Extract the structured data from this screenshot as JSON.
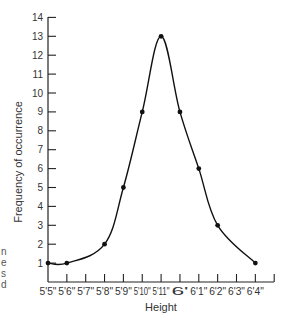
{
  "chart_data": {
    "type": "line",
    "title": "",
    "xlabel": "Height",
    "ylabel": "Frequency of occurrence",
    "categories": [
      "5'5\"",
      "5'6\"",
      "5'7\"",
      "5'8\"",
      "5'9\"",
      "5'10\"",
      "5'11\"",
      "6'",
      "6'1\"",
      "6'2\"",
      "6'3\"",
      "6'4\""
    ],
    "x_tick_labels": [
      "5'5\"",
      "5'6\"",
      "5'7\"",
      "5'8\"",
      "5'9\"",
      "5'10\"",
      "5'11\"",
      "6'",
      "6'1\"",
      "6'2\"",
      "6'3\"",
      "6'4\""
    ],
    "y_ticks": [
      1,
      2,
      3,
      4,
      5,
      6,
      7,
      8,
      9,
      10,
      11,
      12,
      13,
      14
    ],
    "ylim": [
      0,
      14
    ],
    "grid": false,
    "legend": null,
    "smooth_curve": true,
    "series": [
      {
        "name": "Frequency",
        "points": [
          {
            "x": "5'5\"",
            "y": 1
          },
          {
            "x": "5'6\"",
            "y": 1
          },
          {
            "x": "5'8\"",
            "y": 2
          },
          {
            "x": "5'9\"",
            "y": 5
          },
          {
            "x": "5'10\"",
            "y": 9
          },
          {
            "x": "5'11\"",
            "y": 13
          },
          {
            "x": "6'",
            "y": 9
          },
          {
            "x": "6'1\"",
            "y": 6
          },
          {
            "x": "6'2\"",
            "y": 3
          },
          {
            "x": "6'4\"",
            "y": 1
          }
        ]
      }
    ]
  },
  "edge_fragments": [
    "n",
    "e",
    "s",
    "d"
  ]
}
